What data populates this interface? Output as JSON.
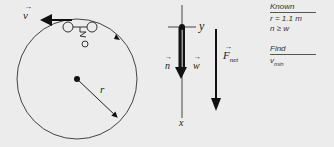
{
  "diagram": {
    "motion_view": {
      "velocity_label": "v",
      "radius_label": "r"
    },
    "free_body": {
      "axis_y_label": "y",
      "axis_x_label": "x",
      "normal_label": "n",
      "weight_label": "w",
      "net_force_label": "F",
      "net_force_subscript": "net"
    },
    "known_panel": {
      "known_header": "Known",
      "known_items": [
        "r = 1.1 m",
        "n ≥ w"
      ],
      "find_header": "Find",
      "find_item": "v",
      "find_subscript": "min"
    }
  }
}
